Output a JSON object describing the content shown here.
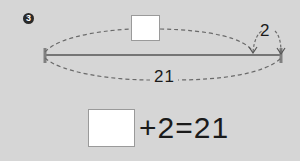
{
  "problem": {
    "number_badge": "3",
    "diagram": {
      "total_label": "21",
      "part_label": "2",
      "unknown_box": ""
    },
    "equation": {
      "answer_box": "",
      "text": "+2=21"
    }
  },
  "colors": {
    "background": "#d6d6d6",
    "line": "#555555",
    "dash": "#6a6a6a",
    "text": "#1a1a1a"
  }
}
